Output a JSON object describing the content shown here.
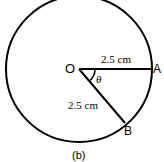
{
  "diagram": {
    "caption": "(b)",
    "center_label": "O",
    "point_a_label": "A",
    "point_b_label": "B",
    "angle_label": "θ",
    "radius_oa_label": "2.5 cm",
    "radius_ob_label": "2.5 cm",
    "stroke_color": "#000000"
  }
}
